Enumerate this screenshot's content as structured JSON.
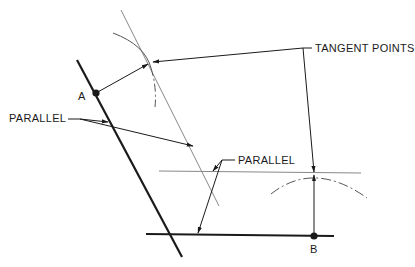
{
  "diagram": {
    "labels": {
      "tangent_points": "TANGENT POINTS",
      "parallel_left": "PARALLEL",
      "parallel_right": "PARALLEL",
      "point_a": "A",
      "point_b": "B"
    },
    "colors": {
      "ink": "#1a1a1a",
      "thin_line": "#777777",
      "background": "#ffffff"
    }
  }
}
